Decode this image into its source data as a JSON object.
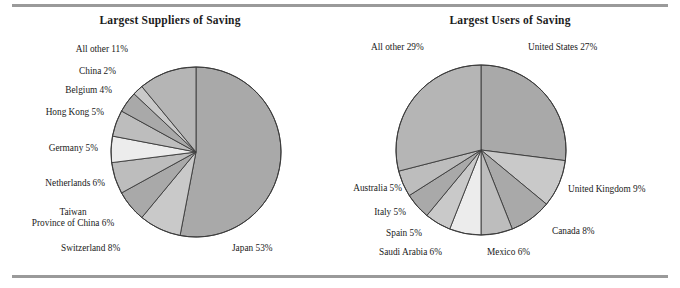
{
  "figure": {
    "background": "#ffffff",
    "rule_color": "#9a9a9a",
    "text_color": "#1a1a1a"
  },
  "charts": [
    {
      "id": "largest-suppliers-of-saving",
      "title": "Largest Suppliers of Saving",
      "center": {
        "x": 196,
        "y": 152
      },
      "radius": 85,
      "start_angle_deg": 0,
      "direction": "clockwise"
    },
    {
      "id": "largest-users-of-saving",
      "title": "Largest Users of Saving",
      "center": {
        "x": 141,
        "y": 150
      },
      "radius": 85,
      "start_angle_deg": 0,
      "direction": "clockwise"
    }
  ],
  "chart_data": [
    {
      "type": "pie",
      "title": "Largest Suppliers of Saving",
      "xlabel": "",
      "ylabel": "",
      "unit": "percent",
      "total": 100,
      "legend": "none",
      "labels_inline": true,
      "categories": [
        "Japan",
        "Switzerland",
        "Taiwan Province of China",
        "Netherlands",
        "Germany",
        "Hong Kong",
        "Belgium",
        "China",
        "All other"
      ],
      "values": [
        53,
        8,
        6,
        6,
        5,
        5,
        4,
        2,
        11
      ],
      "slice_labels": [
        "Japan 53%",
        "Switzerland 8%",
        "Taiwan\nProvince of China 6%",
        "Netherlands 6%",
        "Germany 5%",
        "Hong Kong 5%",
        "Belgium 4%",
        "China 2%",
        "All other 11%"
      ],
      "colors": [
        "#a9a9a9",
        "#c9c9c9",
        "#a9a9a9",
        "#bdbdbd",
        "#ececec",
        "#bdbdbd",
        "#a9a9a9",
        "#c9c9c9",
        "#b5b5b5"
      ]
    },
    {
      "type": "pie",
      "title": "Largest Users of Saving",
      "xlabel": "",
      "ylabel": "",
      "unit": "percent",
      "total": 100,
      "legend": "none",
      "labels_inline": true,
      "categories": [
        "United States",
        "United Kingdom",
        "Canada",
        "Mexico",
        "Saudi Arabia",
        "Spain",
        "Italy",
        "Australia",
        "All other"
      ],
      "values": [
        27,
        9,
        8,
        6,
        6,
        5,
        5,
        5,
        29
      ],
      "slice_labels": [
        "United States 27%",
        "United Kingdom 9%",
        "Canada 8%",
        "Mexico 6%",
        "Saudi Arabia 6%",
        "Spain 5%",
        "Italy 5%",
        "Australia 5%",
        "All other 29%"
      ],
      "colors": [
        "#a9a9a9",
        "#c9c9c9",
        "#a9a9a9",
        "#bdbdbd",
        "#ececec",
        "#c9c9c9",
        "#a9a9a9",
        "#bdbdbd",
        "#b5b5b5"
      ]
    }
  ],
  "left_labels": {
    "all_other": "All other 11%",
    "china": "China 2%",
    "belgium": "Belgium 4%",
    "hong_kong": "Hong Kong 5%",
    "germany": "Germany 5%",
    "netherlands": "Netherlands 6%",
    "taiwan_line1": "Taiwan",
    "taiwan_line2": "Province of China 6%",
    "switzerland": "Switzerland 8%",
    "japan": "Japan 53%"
  },
  "right_labels": {
    "all_other": "All other 29%",
    "united_states": "United States 27%",
    "united_kingdom": "United Kingdom 9%",
    "canada": "Canada 8%",
    "mexico": "Mexico 6%",
    "saudi_arabia": "Saudi Arabia 6%",
    "spain": "Spain 5%",
    "italy": "Italy 5%",
    "australia": "Australia 5%"
  }
}
